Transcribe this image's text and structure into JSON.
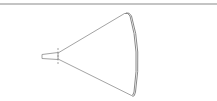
{
  "diagram": {
    "type": "horn-antenna-beam",
    "colors": {
      "background": "#ffffff",
      "top_rule": "#8a8a8a",
      "stroke": "#8c8c8c",
      "arc_stroke": "#7a7a7a"
    },
    "elements": [
      {
        "id": "top-rule",
        "kind": "line",
        "from": [
          0,
          4
        ],
        "to": [
          217,
          4
        ]
      },
      {
        "id": "feed",
        "kind": "trapezoid",
        "points": [
          [
            42,
            54
          ],
          [
            58,
            52
          ],
          [
            58,
            60
          ],
          [
            42,
            59
          ]
        ]
      },
      {
        "id": "aperture-marker",
        "kind": "dashed-line",
        "from": [
          58,
          48
        ],
        "to": [
          58,
          64
        ]
      },
      {
        "id": "beam-upper-edge",
        "kind": "line",
        "from": [
          58,
          53
        ],
        "to": [
          125,
          13
        ]
      },
      {
        "id": "beam-lower-edge",
        "kind": "line",
        "from": [
          58,
          59
        ],
        "to": [
          132,
          96
        ]
      },
      {
        "id": "wavefront-arc",
        "kind": "double-arc",
        "from": [
          125,
          13
        ],
        "to": [
          132,
          96
        ],
        "bulge_x": 138
      }
    ]
  }
}
